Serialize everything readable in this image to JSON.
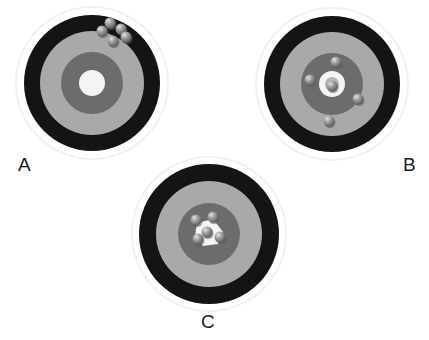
{
  "figure": {
    "colors": {
      "halo": "#f1f1f1",
      "outer_ring": "#141414",
      "middle_ring": "#a9a9a9",
      "inner_ring": "#6c6c6c",
      "bullseye": "#f4f4f4",
      "bullseye_core": "#b5b5b5",
      "shot": "#9c9c9c",
      "shot_highlight": "#dcdcdc",
      "shot_shadow": "#5a5a5a"
    },
    "targets": [
      {
        "id": "A",
        "label": "A",
        "center": [
          92,
          83
        ],
        "label_pos": [
          18,
          155
        ],
        "radii": {
          "halo": 76,
          "outer": 68,
          "middle": 52,
          "inner": 31,
          "bullseye": 13
        },
        "bullseye_core": false,
        "bullseye_patch": false,
        "shots": [
          [
            102,
            31
          ],
          [
            110,
            23
          ],
          [
            121,
            29
          ],
          [
            113,
            41
          ],
          [
            126,
            37
          ]
        ]
      },
      {
        "id": "B",
        "label": "B",
        "center": [
          332,
          84
        ],
        "label_pos": [
          403,
          155
        ],
        "radii": {
          "halo": 76,
          "outer": 68,
          "middle": 52,
          "inner": 31,
          "bullseye": 13
        },
        "bullseye_core": true,
        "bullseye_patch": false,
        "shots": [
          [
            336,
            62
          ],
          [
            310,
            80
          ],
          [
            332,
            86
          ],
          [
            358,
            99
          ],
          [
            329,
            121
          ]
        ]
      },
      {
        "id": "C",
        "label": "C",
        "center": [
          209,
          234
        ],
        "label_pos": [
          201,
          312
        ],
        "radii": {
          "halo": 77,
          "outer": 70,
          "middle": 53,
          "inner": 31,
          "bullseye": 0
        },
        "bullseye_core": false,
        "bullseye_patch": true,
        "shots": [
          [
            196,
            220
          ],
          [
            213,
            217
          ],
          [
            207,
            232
          ],
          [
            198,
            239
          ],
          [
            220,
            237
          ]
        ]
      }
    ]
  }
}
